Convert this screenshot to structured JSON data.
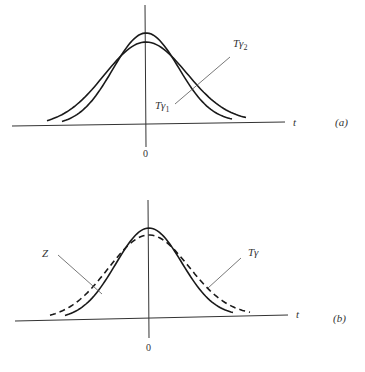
{
  "panels": [
    {
      "id": "a",
      "panel_label": "(a)",
      "axis_label": "t",
      "origin_label": "0",
      "curves": [
        {
          "name": "T_gamma_2",
          "label": "Tγ",
          "subscript": "2",
          "style": "solid",
          "relative_peak": 0.85,
          "relative_width": 1.25
        },
        {
          "name": "T_gamma_1",
          "label": "Tγ",
          "subscript": "1",
          "style": "solid",
          "relative_peak": 0.95,
          "relative_width": 1.0
        }
      ]
    },
    {
      "id": "b",
      "panel_label": "(b)",
      "axis_label": "t",
      "origin_label": "0",
      "curves": [
        {
          "name": "Z",
          "label": "Z",
          "subscript": "",
          "style": "solid",
          "relative_peak": 0.95,
          "relative_width": 1.0
        },
        {
          "name": "T_gamma",
          "label": "Tγ",
          "subscript": "",
          "style": "dashed",
          "relative_peak": 0.85,
          "relative_width": 1.22
        }
      ]
    }
  ]
}
